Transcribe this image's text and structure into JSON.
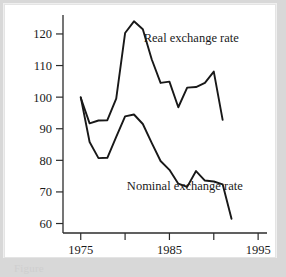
{
  "figure": {
    "caption_fragment": "Figure"
  },
  "chart_data": {
    "type": "line",
    "title": "",
    "subtitle": "",
    "xlabel": "",
    "ylabel": "",
    "xlim": [
      1973,
      1996
    ],
    "ylim": [
      57,
      126
    ],
    "grid": false,
    "legend_position": "inline-annotation",
    "x_ticks": [
      1975,
      1980,
      1985,
      1990,
      1995
    ],
    "x_tick_labels": [
      "1975",
      "",
      "1985",
      "",
      "1995"
    ],
    "y_ticks": [
      60,
      70,
      80,
      90,
      100,
      110,
      120
    ],
    "y_tick_labels": [
      "60",
      "70",
      "80",
      "90",
      "100",
      "110",
      "120"
    ],
    "annotations": [
      {
        "text": "Real exchange rate",
        "x": 1982.1,
        "y": 117.5
      },
      {
        "text": "Nominal exchange rate",
        "x": 1980.2,
        "y": 70.6
      }
    ],
    "series": [
      {
        "name": "Real exchange rate",
        "x": [
          1975,
          1976,
          1977,
          1978,
          1979,
          1980,
          1981,
          1982,
          1983,
          1984,
          1985,
          1986,
          1987,
          1988,
          1989,
          1990,
          1991,
          1992,
          1993
        ],
        "values": [
          99.8,
          91.7,
          92.6,
          92.7,
          99.5,
          120.3,
          124.0,
          121.5,
          112.0,
          104.5,
          104.9,
          96.8,
          103.0,
          103.2,
          104.5,
          108.1,
          92.8,
          null,
          null
        ]
      },
      {
        "name": "Nominal exchange rate",
        "x": [
          1975,
          1976,
          1977,
          1978,
          1979,
          1980,
          1981,
          1982,
          1983,
          1984,
          1985,
          1986,
          1987,
          1988,
          1989,
          1990,
          1991,
          1992,
          1993
        ],
        "values": [
          100.0,
          85.8,
          80.7,
          80.8,
          87.4,
          93.9,
          94.5,
          91.5,
          85.5,
          79.8,
          77.0,
          72.6,
          71.6,
          76.6,
          73.6,
          73.3,
          72.4,
          61.5,
          null
        ]
      }
    ]
  }
}
